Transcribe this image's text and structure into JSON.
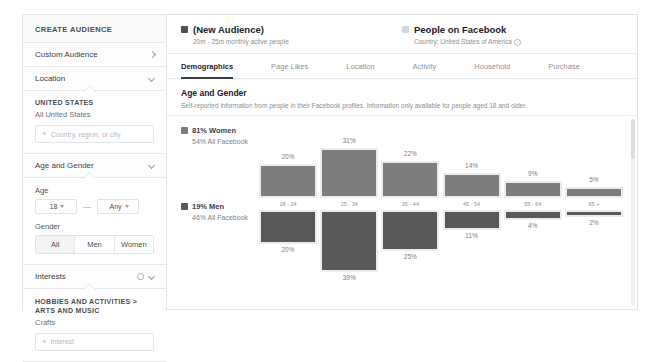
{
  "sidebar": {
    "title": "CREATE AUDIENCE",
    "custom_audience": {
      "label": "Custom Audience",
      "chevron": "chevron-right-icon"
    },
    "location": {
      "label": "Location",
      "chevron": "chevron-down-icon"
    },
    "location_panel": {
      "heading": "UNITED STATES",
      "value": "All United States",
      "input_placeholder": "Country, region, or city",
      "plus": "+"
    },
    "age_gender": {
      "label": "Age and Gender",
      "chevron": "chevron-down-icon"
    },
    "age_panel": {
      "age_label": "Age",
      "age_min": "18",
      "age_dash": "—",
      "age_max": "Any",
      "gender_label": "Gender",
      "gender_options": [
        "All",
        "Men",
        "Women"
      ],
      "gender_selected": "All"
    },
    "interests": {
      "label": "Interests",
      "gear": "gear-icon",
      "chevron": "chevron-down-icon"
    },
    "interests_panel": {
      "path_line1": "HOBBIES AND ACTIVITIES >",
      "path_line2": "ARTS AND MUSIC",
      "item": "Crafts",
      "input_placeholder": "Interest",
      "plus": "+"
    }
  },
  "header": {
    "audience": {
      "title": "(New Audience)",
      "subtitle": "20m - 25m monthly active people",
      "swatch_color": "#4b4f56"
    },
    "comparison": {
      "title": "People on Facebook",
      "subtitle": "Country: United States of America",
      "swatch_color": "#d4d6da",
      "info_icon": "info-icon"
    }
  },
  "tabs": [
    {
      "label": "Demographics",
      "active": true
    },
    {
      "label": "Page Likes",
      "active": false
    },
    {
      "label": "Location",
      "active": false
    },
    {
      "label": "Activity",
      "active": false
    },
    {
      "label": "Household",
      "active": false
    },
    {
      "label": "Purchase",
      "active": false
    }
  ],
  "section": {
    "title": "Age and Gender",
    "description": "Self-reported information from people in their Facebook profiles. Information only available for people aged 18 and older."
  },
  "chart_data": {
    "type": "bar",
    "title": "Age and Gender",
    "orientation": "diverging-vertical",
    "categories": [
      "18 - 24",
      "25 - 34",
      "35 - 44",
      "45 - 54",
      "55 - 64",
      "65 +"
    ],
    "xlabel": "",
    "ylabel": "",
    "ylim": [
      0,
      40
    ],
    "grid": false,
    "legend_position": "left",
    "series": [
      {
        "name": "Women",
        "direction": "up",
        "color": "#7d7d7d",
        "legend_title": "81% Women",
        "legend_subtitle": "54% All Facebook",
        "values": [
          20,
          31,
          22,
          14,
          9,
          5
        ],
        "value_labels": [
          "20%",
          "31%",
          "22%",
          "14%",
          "9%",
          "5%"
        ]
      },
      {
        "name": "Men",
        "direction": "down",
        "color": "#595959",
        "legend_title": "19% Men",
        "legend_subtitle": "46% All Facebook",
        "values": [
          20,
          39,
          25,
          11,
          4,
          2
        ],
        "value_labels": [
          "20%",
          "39%",
          "25%",
          "11%",
          "4%",
          "2%"
        ]
      }
    ],
    "benchmark_color": "#ececec"
  }
}
